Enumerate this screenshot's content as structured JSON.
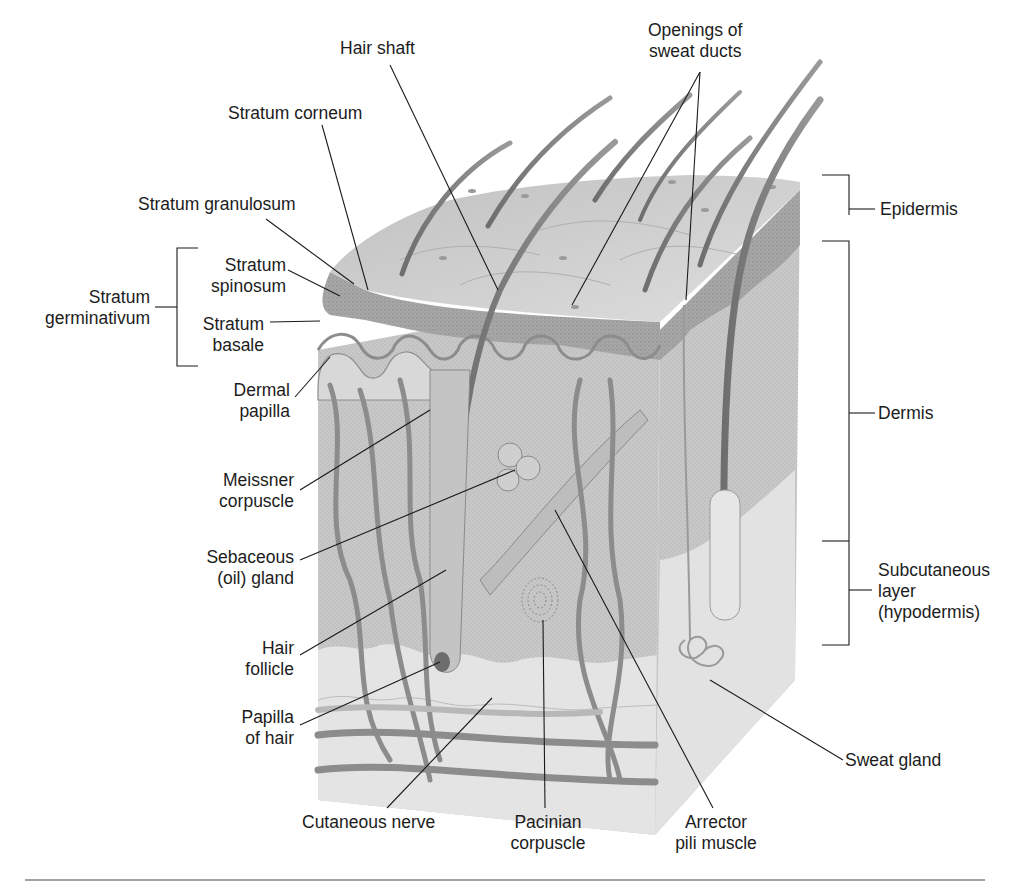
{
  "figure": {
    "colors": {
      "background": "#ffffff",
      "ink": "#1a1a1a",
      "tissue_light": "#d9d9d9",
      "tissue_mid": "#b5b5b5",
      "tissue_dark": "#7a7a7a"
    }
  },
  "labels": {
    "hair_shaft": [
      "Hair shaft"
    ],
    "openings_sweat_ducts": [
      "Openings of",
      "sweat ducts"
    ],
    "stratum_corneum": [
      "Stratum corneum"
    ],
    "stratum_granulosum": [
      "Stratum granulosum"
    ],
    "stratum_spinosum": [
      "Stratum",
      "spinosum"
    ],
    "stratum_germinativum": [
      "Stratum",
      "germinativum"
    ],
    "stratum_basale": [
      "Stratum",
      "basale"
    ],
    "dermal_papilla": [
      "Dermal",
      "papilla"
    ],
    "meissner_corpuscle": [
      "Meissner",
      "corpuscle"
    ],
    "sebaceous_gland": [
      "Sebaceous",
      "(oil) gland"
    ],
    "hair_follicle": [
      "Hair",
      "follicle"
    ],
    "papilla_of_hair": [
      "Papilla",
      "of hair"
    ],
    "cutaneous_nerve": [
      "Cutaneous nerve"
    ],
    "pacinian_corpuscle": [
      "Pacinian",
      "corpuscle"
    ],
    "arrector_pili": [
      "Arrector",
      "pili muscle"
    ],
    "sweat_gland": [
      "Sweat gland"
    ],
    "epidermis": [
      "Epidermis"
    ],
    "dermis": [
      "Dermis"
    ],
    "subcutaneous": [
      "Subcutaneous",
      "layer",
      "(hypodermis)"
    ]
  }
}
